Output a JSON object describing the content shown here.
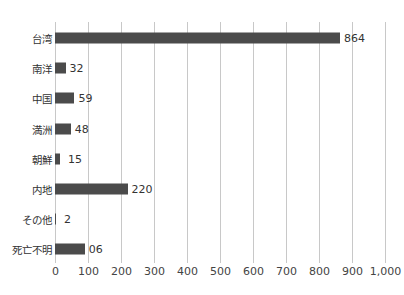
{
  "chart_data": {
    "type": "bar",
    "orientation": "horizontal",
    "title": "",
    "xlabel": "",
    "ylabel": "",
    "categories": [
      "台湾",
      "南洋",
      "中国",
      "満洲",
      "朝鮮",
      "内地",
      "その他",
      "死亡不明"
    ],
    "values": [
      864,
      32,
      59,
      48,
      15,
      220,
      2,
      90
    ],
    "data_labels": [
      "864",
      "32",
      "59",
      "48",
      "15",
      "220",
      "2",
      "06"
    ],
    "xlim": [
      0,
      1000
    ],
    "xticks": [
      "0",
      "100",
      "200",
      "300",
      "400",
      "500",
      "600",
      "700",
      "800",
      "900",
      "1,000"
    ],
    "grid": true,
    "legend": null,
    "bar_color": "#4b4b4b",
    "grid_color": "#c8c8c8"
  }
}
